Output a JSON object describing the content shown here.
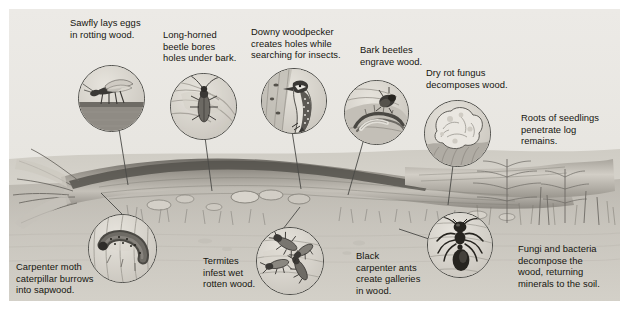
{
  "figure": {
    "panel_background": "#e9e9e7",
    "text_color": "#15150f",
    "line_color": "#4a4a46"
  },
  "labels": [
    {
      "id": "sawfly",
      "text": "Sawfly lays eggs\nin rotting wood.",
      "x": 70,
      "y": 17,
      "w": 104
    },
    {
      "id": "longhorned",
      "text": "Long-horned\nbeetle bores\nholes under bark.",
      "x": 163,
      "y": 29,
      "w": 86
    },
    {
      "id": "woodpecker",
      "text": "Downy woodpecker\ncreates holes while\nsearching for insects.",
      "x": 251,
      "y": 26,
      "w": 108
    },
    {
      "id": "barkbeetle",
      "text": "Bark beetles\nengrave wood.",
      "x": 360,
      "y": 44,
      "w": 70
    },
    {
      "id": "dryrot",
      "text": "Dry rot fungus\ndecomposes wood.",
      "x": 426,
      "y": 67,
      "w": 94
    },
    {
      "id": "roots",
      "text": "Roots of seedlings\npenetrate log\nremains.",
      "x": 521,
      "y": 112,
      "w": 98
    },
    {
      "id": "carpentermoth",
      "text": "Carpenter moth\ncaterpillar burrows\ninto sapwood.",
      "x": 16,
      "y": 261,
      "w": 104
    },
    {
      "id": "termites",
      "text": "Termites\ninfest wet\nrotten wood.",
      "x": 203,
      "y": 255,
      "w": 66
    },
    {
      "id": "blackants",
      "text": "Black\ncarpenter ants\ncreate galleries\nin wood.",
      "x": 356,
      "y": 250,
      "w": 78
    },
    {
      "id": "fungibacteria",
      "text": "Fungi and bacteria\ndecompose the\nwood, returning\nminerals to the soil.",
      "x": 518,
      "y": 243,
      "w": 104
    }
  ],
  "callouts": [
    {
      "id": "sawfly",
      "subject": "sawfly-insect",
      "x": 78,
      "y": 65,
      "d": 65
    },
    {
      "id": "longhorned",
      "subject": "long-horned-beetle",
      "x": 170,
      "y": 73,
      "d": 65
    },
    {
      "id": "woodpecker",
      "subject": "downy-woodpecker-bird",
      "x": 261,
      "y": 68,
      "d": 64
    },
    {
      "id": "barkbeetle",
      "subject": "bark-beetle-galleries",
      "x": 344,
      "y": 80,
      "d": 63
    },
    {
      "id": "dryrot",
      "subject": "dry-rot-fungus",
      "x": 424,
      "y": 100,
      "d": 65
    },
    {
      "id": "carpentermoth",
      "subject": "carpenter-moth-caterpillar",
      "x": 88,
      "y": 214,
      "d": 67
    },
    {
      "id": "termites",
      "subject": "termites",
      "x": 256,
      "y": 227,
      "d": 66
    },
    {
      "id": "blackants",
      "subject": "black-carpenter-ant",
      "x": 427,
      "y": 212,
      "d": 64
    }
  ],
  "leaders": [
    {
      "id": "sawfly",
      "from": [
        119,
        129
      ],
      "to": [
        128,
        176
      ]
    },
    {
      "id": "longhorned",
      "from": [
        201,
        137
      ],
      "to": [
        212,
        182
      ]
    },
    {
      "id": "woodpecker",
      "from": [
        288,
        131
      ],
      "to": [
        300,
        180
      ]
    },
    {
      "id": "barkbeetle",
      "from": [
        362,
        142
      ],
      "to": [
        346,
        186
      ]
    },
    {
      "id": "dryrot",
      "from": [
        452,
        164
      ],
      "to": [
        447,
        196
      ]
    },
    {
      "id": "carpentermoth",
      "from": [
        124,
        216
      ],
      "to": [
        100,
        192
      ]
    },
    {
      "id": "termites",
      "from": [
        282,
        228
      ],
      "to": [
        300,
        206
      ]
    },
    {
      "id": "blackants",
      "from": [
        428,
        238
      ],
      "to": [
        398,
        228
      ]
    }
  ],
  "scene": {
    "log_description": "fallen decaying log with splintered end, bracket fungi and mushrooms",
    "ground_description": "forest floor with soil, leaf litter and grasses",
    "seedlings_description": "fern and conifer seedlings growing from log remains"
  }
}
